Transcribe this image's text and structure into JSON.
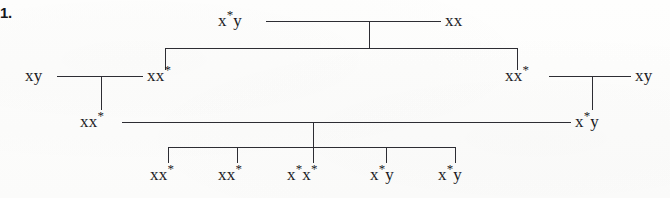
{
  "item": {
    "number": "1."
  },
  "diagram": {
    "type": "tree",
    "line_color": "#2d2d33",
    "background_color": "#fdfdfc",
    "nodes": [
      {
        "id": "n1",
        "label": "x*y",
        "base": "x*y",
        "row": 1,
        "x": 218,
        "y": 21
      },
      {
        "id": "n2",
        "label": "xx",
        "base": "xx",
        "row": 1,
        "x": 445,
        "y": 21
      },
      {
        "id": "n3",
        "label": "xy",
        "base": "xy",
        "row": 2,
        "x": 25,
        "y": 76
      },
      {
        "id": "n4",
        "label": "xx*",
        "base": "xx*",
        "row": 2,
        "x": 147,
        "y": 76
      },
      {
        "id": "n5",
        "label": "xx*",
        "base": "xx*",
        "row": 2,
        "x": 505,
        "y": 76
      },
      {
        "id": "n6",
        "label": "xy",
        "base": "xy",
        "row": 2,
        "x": 635,
        "y": 76
      },
      {
        "id": "n7",
        "label": "xx*",
        "base": "xx*",
        "row": 3,
        "x": 80,
        "y": 122
      },
      {
        "id": "n8",
        "label": "x*y",
        "base": "x*y",
        "row": 3,
        "x": 575,
        "y": 122
      },
      {
        "id": "n9",
        "label": "xx*",
        "base": "xx*",
        "row": 4,
        "x": 150,
        "y": 175
      },
      {
        "id": "n10",
        "label": "xx*",
        "base": "xx*",
        "row": 4,
        "x": 218,
        "y": 175
      },
      {
        "id": "n11",
        "label": "x*x*",
        "base": "x*x*",
        "row": 4,
        "x": 287,
        "y": 175
      },
      {
        "id": "n12",
        "label": "x*y",
        "base": "x*y",
        "row": 4,
        "x": 370,
        "y": 175
      },
      {
        "id": "n13",
        "label": "x*y",
        "base": "x*y",
        "row": 4,
        "x": 438,
        "y": 175
      }
    ],
    "leaf_ticks": [
      168,
      237,
      313,
      386,
      455
    ],
    "rows": {
      "row1_rule_y": 21,
      "row2_rule_y": 48,
      "row3_rule_y": 76,
      "row4_rule_y": 122,
      "leaf_bar_y": 147
    }
  }
}
